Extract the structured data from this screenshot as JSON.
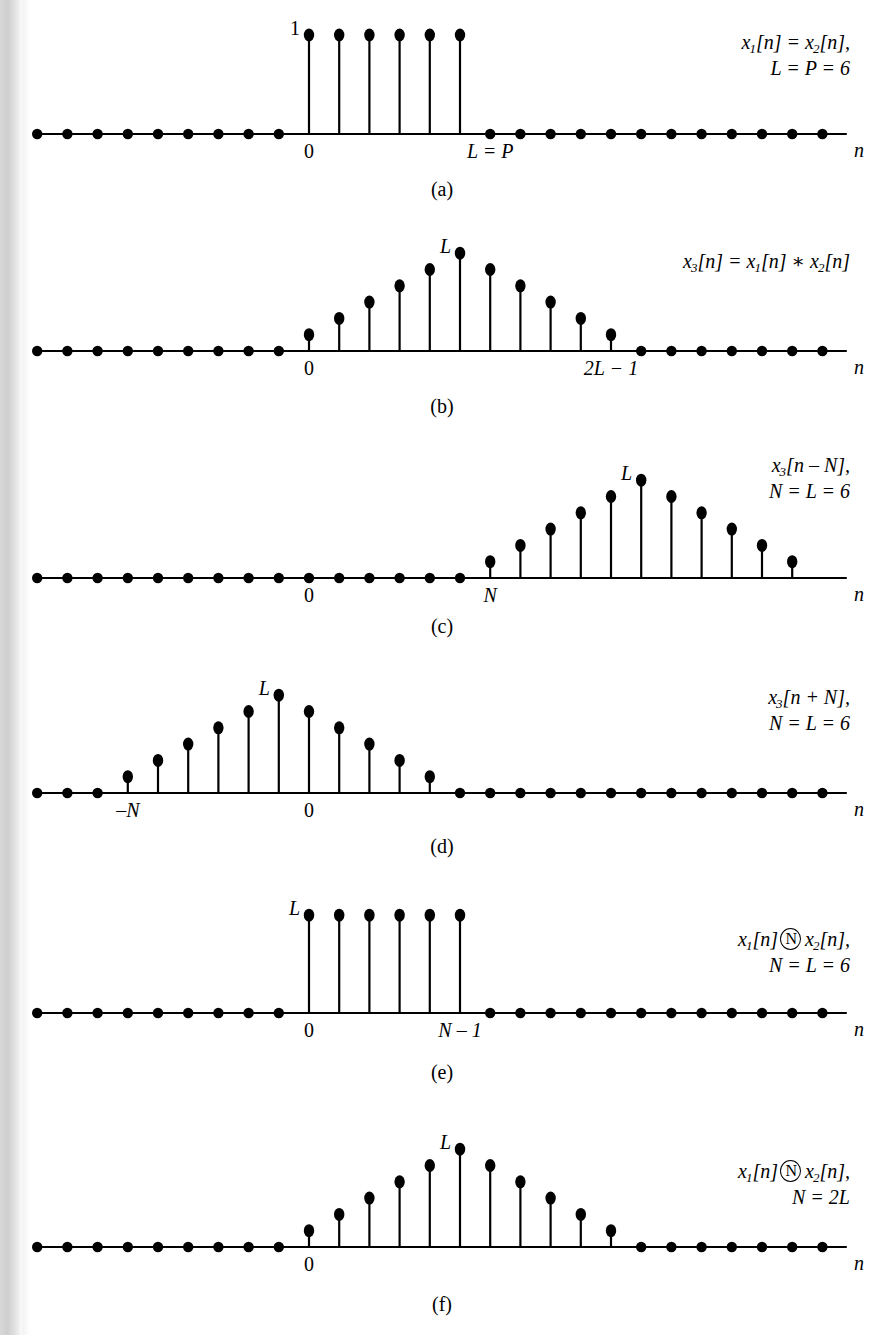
{
  "figure": {
    "axis_name": "n",
    "geometry": {
      "x_origin": 309,
      "dx": 30.2,
      "axis_x_start": 40,
      "axis_x_end": 846,
      "unit_height": 16.3,
      "dot_r": 5.2
    }
  },
  "chart_data": {
    "type": "stem-multi",
    "xlabel": "n",
    "ylabel": "",
    "grid": false,
    "legend": null,
    "shared": {
      "x_min": -9,
      "x_max": 18,
      "stem_spacing_px": 30.2,
      "zero_x_px": 309
    },
    "panels": [
      {
        "id": "a",
        "caption": "(a)",
        "baseline_y": 134,
        "amplitude_label": "1",
        "amplitude_label_n": 0,
        "annotation_lines": [
          "x1[n] = x2[n],",
          "L = P = 6"
        ],
        "x": [
          0,
          1,
          2,
          3,
          4,
          5
        ],
        "values": [
          1,
          1,
          1,
          1,
          1,
          1
        ],
        "unit_px": 99,
        "zero_dots_from": -9,
        "zero_dots_to": 17,
        "tick_labels": [
          {
            "text": "0",
            "n": 0,
            "italic": false
          },
          {
            "text": "L = P",
            "n": 6,
            "italic": true
          }
        ]
      },
      {
        "id": "b",
        "caption": "(b)",
        "baseline_y": 351,
        "amplitude_label": "L",
        "amplitude_label_n": 5,
        "annotation_lines": [
          "x3[n] = x1[n] * x2[n]"
        ],
        "x": [
          0,
          1,
          2,
          3,
          4,
          5,
          6,
          7,
          8,
          9,
          10
        ],
        "values": [
          1,
          2,
          3,
          4,
          5,
          6,
          5,
          4,
          3,
          2,
          1
        ],
        "unit_px": 16.3,
        "zero_dots_from": -9,
        "zero_dots_to": 17,
        "tick_labels": [
          {
            "text": "0",
            "n": 0,
            "italic": false
          },
          {
            "text": "2L − 1",
            "n": 10,
            "italic": true
          }
        ]
      },
      {
        "id": "c",
        "caption": "(c)",
        "baseline_y": 578,
        "amplitude_label": "L",
        "amplitude_label_n": 11,
        "annotation_lines": [
          "x3[n − N],",
          "N = L = 6"
        ],
        "x": [
          6,
          7,
          8,
          9,
          10,
          11,
          12,
          13,
          14,
          15,
          16
        ],
        "values": [
          1,
          2,
          3,
          4,
          5,
          6,
          5,
          4,
          3,
          2,
          1
        ],
        "unit_px": 16.3,
        "zero_dots_from": -9,
        "zero_dots_to": 5,
        "tick_labels": [
          {
            "text": "0",
            "n": 0,
            "italic": false
          },
          {
            "text": "N",
            "n": 6,
            "italic": true
          }
        ]
      },
      {
        "id": "d",
        "caption": "(d)",
        "baseline_y": 793,
        "amplitude_label": "L",
        "amplitude_label_n": -1,
        "annotation_lines": [
          "x3[n + N],",
          "N = L = 6"
        ],
        "x": [
          -6,
          -5,
          -4,
          -3,
          -2,
          -1,
          0,
          1,
          2,
          3,
          4
        ],
        "values": [
          1,
          2,
          3,
          4,
          5,
          6,
          5,
          4,
          3,
          2,
          1
        ],
        "unit_px": 16.3,
        "zero_dots_from": -9,
        "zero_dots_to": 17,
        "zero_dots_skip_from": -6,
        "zero_dots_skip_to": 4,
        "tick_labels": [
          {
            "text": "−N",
            "n": -6,
            "italic": true
          },
          {
            "text": "0",
            "n": 0,
            "italic": false
          }
        ]
      },
      {
        "id": "e",
        "caption": "(e)",
        "baseline_y": 1013,
        "amplitude_label": "L",
        "amplitude_label_n": 0,
        "annotation_lines": [
          "x1[n] (N) x2[n],",
          "N = L = 6"
        ],
        "x": [
          0,
          1,
          2,
          3,
          4,
          5
        ],
        "values": [
          6,
          6,
          6,
          6,
          6,
          6
        ],
        "unit_px": 16.3,
        "zero_dots_from": -9,
        "zero_dots_to": 17,
        "tick_labels": [
          {
            "text": "0",
            "n": 0,
            "italic": false
          },
          {
            "text": "N − 1",
            "n": 5,
            "italic": true
          }
        ]
      },
      {
        "id": "f",
        "caption": "(f)",
        "baseline_y": 1247,
        "amplitude_label": "L",
        "amplitude_label_n": 5,
        "annotation_lines": [
          "x1[n] (N) x2[n],",
          "N = 2L"
        ],
        "x": [
          0,
          1,
          2,
          3,
          4,
          5,
          6,
          7,
          8,
          9,
          10
        ],
        "values": [
          1,
          2,
          3,
          4,
          5,
          6,
          5,
          4,
          3,
          2,
          1
        ],
        "unit_px": 16.3,
        "zero_dots_from": -9,
        "zero_dots_to": 17,
        "tick_labels": [
          {
            "text": "0",
            "n": 0,
            "italic": false
          }
        ]
      }
    ]
  },
  "panels": {
    "a": {
      "caption": "(a)",
      "amp": "1",
      "tick0": "0",
      "tick1": "L = P",
      "annot_l1_a": "x",
      "annot_l1_sub1": "1",
      "annot_l1_b": "[n] = x",
      "annot_l1_sub2": "2",
      "annot_l1_c": "[n],",
      "annot_l2": "L = P = 6"
    },
    "b": {
      "caption": "(b)",
      "amp": "L",
      "tick0": "0",
      "tick1": "2L − 1",
      "annot_l1_a": "x",
      "annot_l1_sub1": "3",
      "annot_l1_b": "[n] = x",
      "annot_l1_sub2": "1",
      "annot_l1_c": "[n] ∗ x",
      "annot_l1_sub3": "2",
      "annot_l1_d": "[n]"
    },
    "c": {
      "caption": "(c)",
      "amp": "L",
      "tick0": "0",
      "tick1": "N",
      "annot_l1_a": "x",
      "annot_l1_sub1": "3",
      "annot_l1_b": "[n – N],",
      "annot_l2": "N = L = 6"
    },
    "d": {
      "caption": "(d)",
      "amp": "L",
      "tick0": "–N",
      "tick1": "0",
      "annot_l1_a": "x",
      "annot_l1_sub1": "3",
      "annot_l1_b": "[n + N],",
      "annot_l2": "N = L = 6"
    },
    "e": {
      "caption": "(e)",
      "amp": "L",
      "tick0": "0",
      "tick1": "N – 1",
      "annot_l1_a": "x",
      "annot_l1_sub1": "1",
      "annot_l1_b": "[n]",
      "annot_circ": "N",
      "annot_l1_c": "x",
      "annot_l1_sub2": "2",
      "annot_l1_d": "[n],",
      "annot_l2": "N = L = 6"
    },
    "f": {
      "caption": "(f)",
      "amp": "L",
      "tick0": "0",
      "annot_l1_a": "x",
      "annot_l1_sub1": "1",
      "annot_l1_b": "[n]",
      "annot_circ": "N",
      "annot_l1_c": "x",
      "annot_l1_sub2": "2",
      "annot_l1_d": "[n],",
      "annot_l2": "N = 2L"
    }
  }
}
